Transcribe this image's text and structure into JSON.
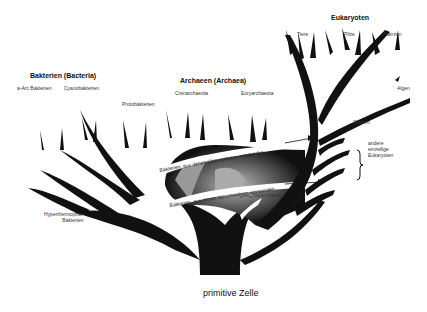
{
  "diagram": {
    "root": "primitive Zelle",
    "groups": {
      "bacteria": "Bakterien (Bacteria)",
      "archaea": "Archaeen (Archaea)",
      "eukarya": "Eukaryoten"
    },
    "leaves": {
      "bacteria_a": "a-Arc Bakterien",
      "cyanobacteria": "Cyanobakterien",
      "proteobacteria": "Protobakterien",
      "crenarchaeota": "Crenarchaeota",
      "euryarchaeota": "Euryarchaeota",
      "animals": "Tiere",
      "fungi": "Pilze",
      "plants": "Pflanzen",
      "algae": "Algen",
      "ciliates": "Ciliaten",
      "other_eukaryotes": "andere\neinzellige\nEukaryoten",
      "korarchaeota": "Korarchaeota",
      "hyperthermophilic": "Hyperthermophile\nBakterien"
    },
    "arrows": {
      "chloroplasts": "Bakterien, aus denen Chloroplasten entstanden",
      "mitochondria": "Bakterien, aus denen Mitochondrien entstanden"
    }
  }
}
